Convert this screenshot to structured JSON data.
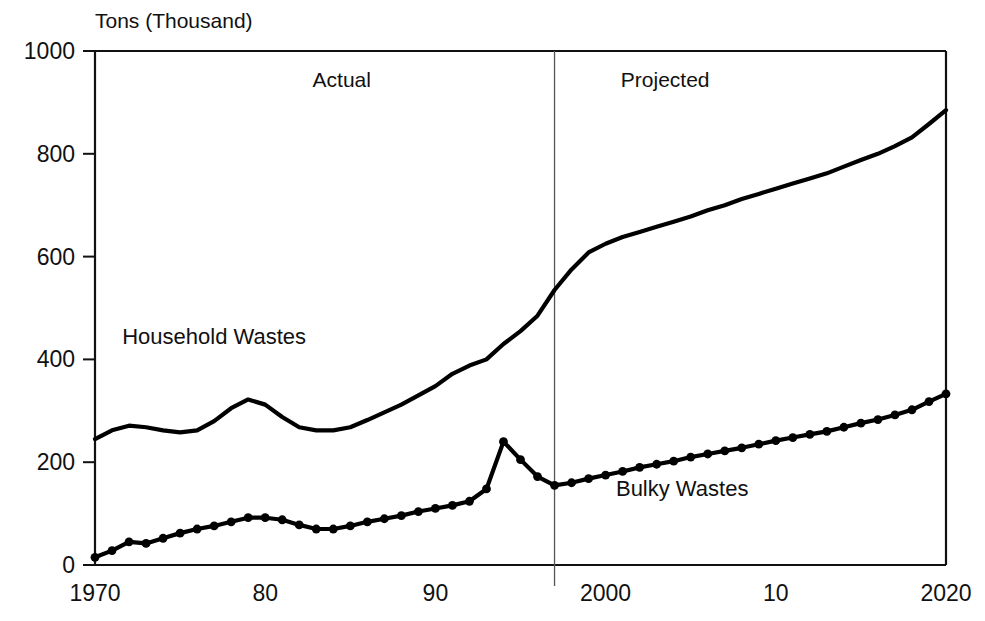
{
  "chart_data": {
    "type": "line",
    "title": "",
    "ylabel": "Tons (Thousand)",
    "xlabel": "",
    "xlim": [
      1970,
      2020
    ],
    "ylim": [
      0,
      1000
    ],
    "grid": false,
    "legend_position": "inline-annotation",
    "y_ticks": [
      0,
      200,
      400,
      600,
      800,
      1000
    ],
    "y_tick_labels": [
      "0",
      "200",
      "400",
      "600",
      "800",
      "1000"
    ],
    "x_ticks": [
      1970,
      1980,
      1990,
      2000,
      2010,
      2020
    ],
    "x_tick_labels": [
      "1970",
      "80",
      "90",
      "2000",
      "10",
      "2020"
    ],
    "annotations": [
      {
        "text": "Actual",
        "x": 1984.5,
        "y": 930
      },
      {
        "text": "Projected",
        "x": 2003.5,
        "y": 930
      },
      {
        "text": "Household Wastes",
        "x": 1977.0,
        "y": 430
      },
      {
        "text": "Bulky Wastes",
        "x": 2004.5,
        "y": 135
      }
    ],
    "divider": {
      "x": 1997,
      "label_left": "Actual",
      "label_right": "Projected"
    },
    "x": [
      1970,
      1971,
      1972,
      1973,
      1974,
      1975,
      1976,
      1977,
      1978,
      1979,
      1980,
      1981,
      1982,
      1983,
      1984,
      1985,
      1986,
      1987,
      1988,
      1989,
      1990,
      1991,
      1992,
      1993,
      1994,
      1995,
      1996,
      1997,
      1998,
      1999,
      2000,
      2001,
      2002,
      2003,
      2004,
      2005,
      2006,
      2007,
      2008,
      2009,
      2010,
      2011,
      2012,
      2013,
      2014,
      2015,
      2016,
      2017,
      2018,
      2019,
      2020
    ],
    "series": [
      {
        "name": "Household Wastes",
        "marker": "none",
        "color": "#000000",
        "values": [
          245,
          262,
          271,
          268,
          262,
          258,
          262,
          280,
          305,
          322,
          312,
          288,
          268,
          262,
          262,
          268,
          282,
          297,
          312,
          330,
          348,
          372,
          388,
          400,
          430,
          455,
          485,
          535,
          575,
          608,
          625,
          638,
          648,
          658,
          668,
          678,
          690,
          700,
          712,
          722,
          732,
          742,
          752,
          762,
          775,
          788,
          800,
          815,
          832,
          858,
          885
        ]
      },
      {
        "name": "Bulky Wastes",
        "marker": "circle",
        "color": "#000000",
        "values": [
          15,
          28,
          45,
          42,
          52,
          62,
          70,
          76,
          84,
          92,
          92,
          88,
          78,
          70,
          70,
          76,
          84,
          90,
          96,
          104,
          110,
          116,
          124,
          148,
          240,
          205,
          172,
          155,
          160,
          168,
          175,
          182,
          190,
          196,
          202,
          210,
          216,
          222,
          228,
          235,
          242,
          248,
          254,
          260,
          268,
          276,
          283,
          292,
          302,
          318,
          333
        ]
      }
    ]
  },
  "figure": {
    "axis_title": "Tons (Thousand)"
  }
}
